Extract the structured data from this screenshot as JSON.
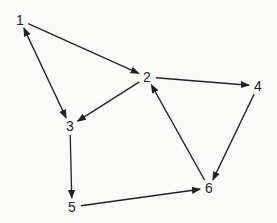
{
  "diagram": {
    "type": "directed-graph",
    "colors": {
      "background": "#fbfbfa",
      "stroke": "#222222",
      "label": "#1e1e1e"
    },
    "nodes": [
      {
        "id": "1",
        "label": "1",
        "x": 20,
        "y": 20
      },
      {
        "id": "2",
        "label": "2",
        "x": 147,
        "y": 77
      },
      {
        "id": "3",
        "label": "3",
        "x": 70,
        "y": 126
      },
      {
        "id": "4",
        "label": "4",
        "x": 258,
        "y": 86
      },
      {
        "id": "5",
        "label": "5",
        "x": 72,
        "y": 207
      },
      {
        "id": "6",
        "label": "6",
        "x": 209,
        "y": 188
      }
    ],
    "edges": [
      {
        "from": "1",
        "to": "2",
        "bidirectional": false
      },
      {
        "from": "1",
        "to": "3",
        "bidirectional": true
      },
      {
        "from": "2",
        "to": "3",
        "bidirectional": false
      },
      {
        "from": "2",
        "to": "4",
        "bidirectional": false
      },
      {
        "from": "3",
        "to": "5",
        "bidirectional": false
      },
      {
        "from": "5",
        "to": "6",
        "bidirectional": false
      },
      {
        "from": "6",
        "to": "2",
        "bidirectional": false
      },
      {
        "from": "4",
        "to": "6",
        "bidirectional": false
      }
    ]
  }
}
